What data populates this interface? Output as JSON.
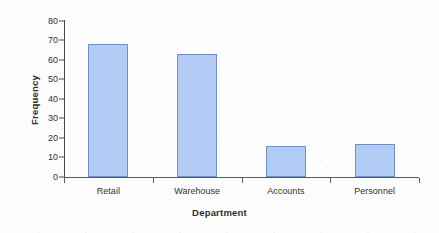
{
  "chart_data": {
    "type": "bar",
    "title": "",
    "xlabel": "Department",
    "ylabel": "Frequency",
    "categories": [
      "Retail",
      "Warehouse",
      "Accounts",
      "Personnel"
    ],
    "values": [
      68,
      63,
      16,
      17
    ],
    "ylim": [
      0,
      80
    ],
    "ytick_labels": [
      "0",
      "10",
      "20",
      "30",
      "40",
      "50",
      "60",
      "70",
      "80"
    ],
    "ytick_values": [
      0,
      10,
      20,
      30,
      40,
      50,
      60,
      70,
      80
    ],
    "grid": false,
    "legend": null,
    "bar_fill_color": "#b3ccf5",
    "bar_border_color": "#6e8fd0",
    "axis_color": "#4a4a4a",
    "text_color": "#303030",
    "background_color": "#fdfdfd"
  }
}
